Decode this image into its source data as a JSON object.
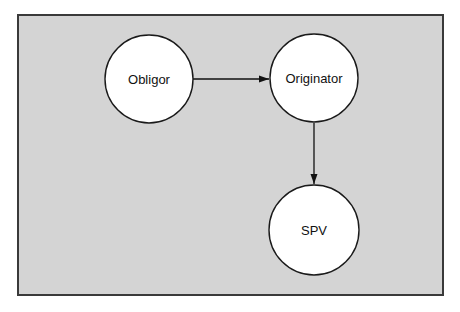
{
  "diagram": {
    "type": "flow",
    "nodes": [
      {
        "id": "obligor",
        "label": "Obligor"
      },
      {
        "id": "originator",
        "label": "Originator"
      },
      {
        "id": "spv",
        "label": "SPV"
      }
    ],
    "edges": [
      {
        "from": "obligor",
        "to": "originator"
      },
      {
        "from": "originator",
        "to": "spv"
      }
    ],
    "colors": {
      "background": "#d4d4d4",
      "border": "#3a3a3a",
      "node_fill": "#ffffff",
      "line": "#111111"
    }
  }
}
